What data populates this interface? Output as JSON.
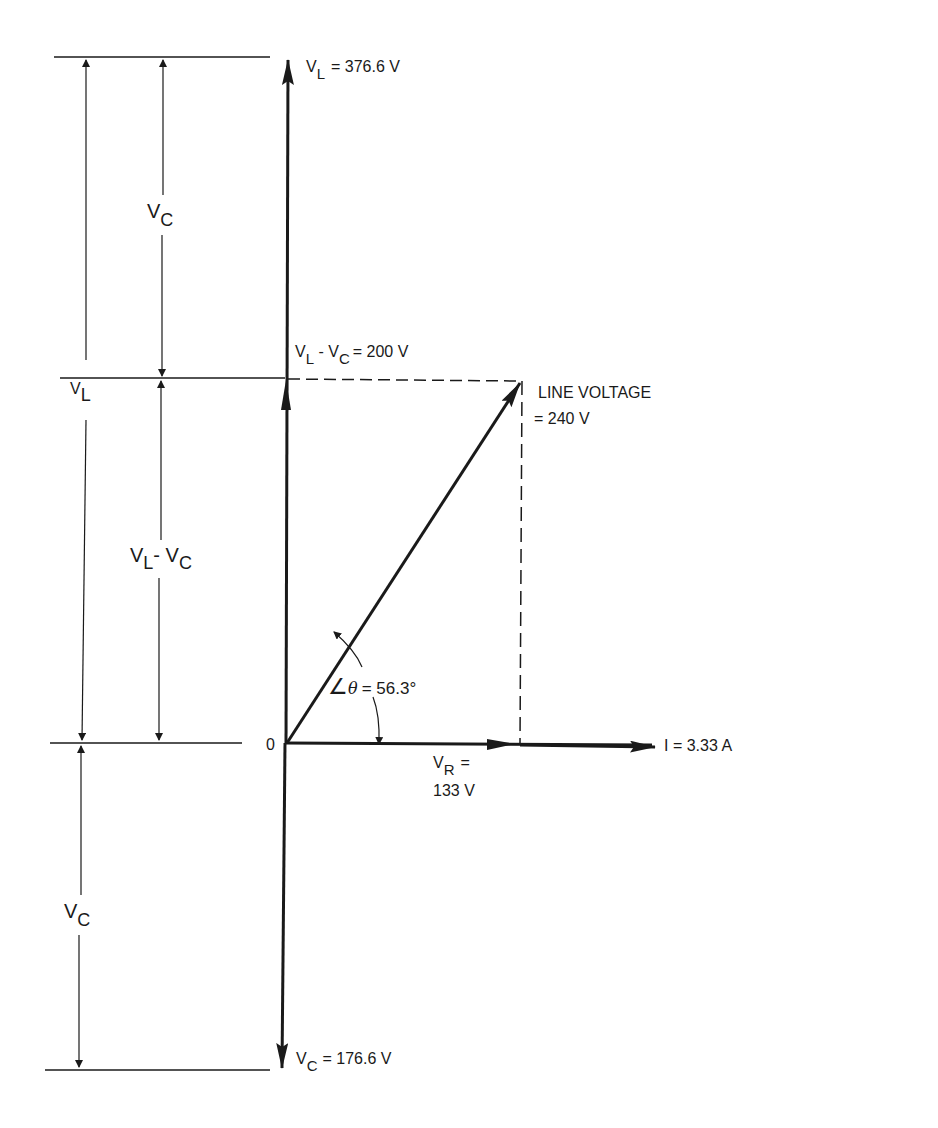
{
  "diagram": {
    "type": "phasor",
    "origin_label": "0",
    "vl_top": {
      "main": "V",
      "sub": "L",
      "value": "= 376.6 V"
    },
    "vc_bottom": {
      "main": "V",
      "sub": "C",
      "value": "= 176.6 V"
    },
    "vl_minus_vc": {
      "main1": "V",
      "sub1": "L",
      "mid": " - ",
      "main2": "V",
      "sub2": "C",
      "value": "= 200 V"
    },
    "line_voltage": {
      "line1": "LINE VOLTAGE",
      "line2": "= 240 V"
    },
    "angle": {
      "symbol": "∠",
      "theta": "θ",
      "value": "= 56.3°"
    },
    "vr": {
      "main": "V",
      "sub": "R",
      "eq": "=",
      "value": "133 V"
    },
    "current": {
      "value": "I = 3.33 A"
    },
    "dim_left": {
      "main": "V",
      "sub": "L"
    },
    "dim_vc_top": {
      "main": "V",
      "sub": "C"
    },
    "dim_vl_vc": {
      "main1": "V",
      "sub1": "L",
      "mid": "- ",
      "main2": "V",
      "sub2": "C"
    },
    "dim_vc_bottom": {
      "main": "V",
      "sub": "C"
    }
  }
}
